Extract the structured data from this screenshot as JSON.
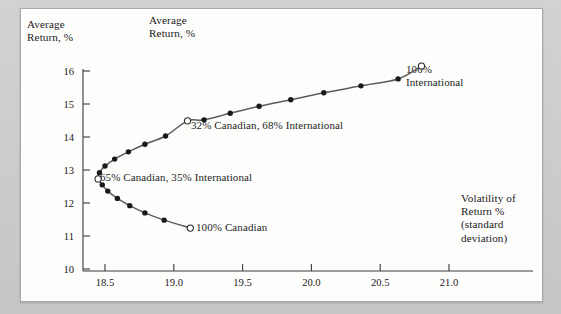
{
  "figure": {
    "y_axis_title": "Average\nReturn, %",
    "chart_title": "Average\nReturn, %",
    "x_axis_title": "Volatility of\nReturn %\n(standard\ndeviation)"
  },
  "chart_data": {
    "type": "line",
    "title": "Average Return, %",
    "xlabel": "Volatility of Return % (standard deviation)",
    "ylabel": "Average Return, %",
    "xlim": [
      18.25,
      21.15
    ],
    "ylim": [
      10,
      16.3
    ],
    "xticks": [
      "18.5",
      "19.0",
      "19.5",
      "20.0",
      "20.5",
      "21.0"
    ],
    "xtick_values": [
      18.5,
      19.0,
      19.5,
      20.0,
      20.5,
      21.0
    ],
    "yticks": [
      "10",
      "11",
      "12",
      "13",
      "14",
      "15",
      "16"
    ],
    "ytick_values": [
      10,
      11,
      12,
      13,
      14,
      15,
      16
    ],
    "grid": false,
    "legend": "none",
    "series": [
      {
        "name": "Canadian / International portfolio frontier",
        "line_color": "#5c5c5c",
        "marker_color": "#1a1a1a",
        "points": [
          {
            "x": 19.12,
            "y": 11.24,
            "marker": "open",
            "label": "100% Canadian"
          },
          {
            "x": 18.93,
            "y": 11.48,
            "marker": "filled"
          },
          {
            "x": 18.79,
            "y": 11.7,
            "marker": "filled"
          },
          {
            "x": 18.68,
            "y": 11.92,
            "marker": "filled"
          },
          {
            "x": 18.59,
            "y": 12.14,
            "marker": "filled"
          },
          {
            "x": 18.52,
            "y": 12.36,
            "marker": "filled"
          },
          {
            "x": 18.48,
            "y": 12.55,
            "marker": "filled"
          },
          {
            "x": 18.45,
            "y": 12.73,
            "marker": "open",
            "label": "65% Canadian, 35% International"
          },
          {
            "x": 18.46,
            "y": 12.92,
            "marker": "filled"
          },
          {
            "x": 18.5,
            "y": 13.12,
            "marker": "filled"
          },
          {
            "x": 18.57,
            "y": 13.33,
            "marker": "filled"
          },
          {
            "x": 18.67,
            "y": 13.55,
            "marker": "filled"
          },
          {
            "x": 18.79,
            "y": 13.78,
            "marker": "filled"
          },
          {
            "x": 18.94,
            "y": 14.03,
            "marker": "filled"
          },
          {
            "x": 19.1,
            "y": 14.49,
            "marker": "open",
            "label": "32% Canadian, 68% International"
          },
          {
            "x": 19.22,
            "y": 14.52,
            "marker": "filled"
          },
          {
            "x": 19.41,
            "y": 14.72,
            "marker": "filled"
          },
          {
            "x": 19.62,
            "y": 14.93,
            "marker": "filled"
          },
          {
            "x": 19.85,
            "y": 15.13,
            "marker": "filled"
          },
          {
            "x": 20.09,
            "y": 15.34,
            "marker": "filled"
          },
          {
            "x": 20.36,
            "y": 15.55,
            "marker": "filled"
          },
          {
            "x": 20.63,
            "y": 15.76,
            "marker": "filled"
          },
          {
            "x": 20.8,
            "y": 16.15,
            "marker": "open",
            "label": "100% International"
          }
        ]
      }
    ],
    "annotations": [
      {
        "text": "100%\nInternational",
        "x": 20.8,
        "y": 16.15
      },
      {
        "text": "32% Canadian, 68% International",
        "x": 19.1,
        "y": 14.49
      },
      {
        "text": "65% Canadian, 35% International",
        "x": 18.45,
        "y": 12.73
      },
      {
        "text": "100% Canadian",
        "x": 19.12,
        "y": 11.24
      }
    ]
  },
  "labels": {
    "intl_100": "100%\nInternational",
    "mix_32": "32% Canadian, 68% International",
    "mix_65": "65% Canadian, 35% International",
    "cdn_100": "100% Canadian"
  },
  "colors": {
    "line": "#5c5c5c",
    "marker": "#1a1a1a",
    "axis": "#3a3a3a",
    "text": "#23201d",
    "panel": "#fdfdfc",
    "page": "#c9c9c7"
  }
}
